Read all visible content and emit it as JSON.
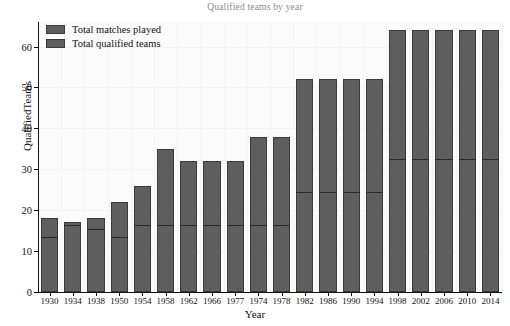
{
  "chart_data": {
    "type": "bar",
    "subtype": "stacked",
    "title": "Qualified teams by year",
    "xlabel": "Year",
    "ylabel": "QualifiedTeams",
    "ylim": [
      0,
      66
    ],
    "yticks": [
      0,
      10,
      20,
      30,
      40,
      50,
      60
    ],
    "grid": true,
    "legend_position": "top-left",
    "categories": [
      "1930",
      "1934",
      "1938",
      "1950",
      "1954",
      "1958",
      "1962",
      "1966",
      "1977",
      "1974",
      "1978",
      "1982",
      "1986",
      "1990",
      "1994",
      "1998",
      "2002",
      "2006",
      "2010",
      "2014"
    ],
    "series": [
      {
        "name": "Total matches played",
        "color": "#5e5e5e",
        "values": [
          18,
          17,
          18,
          22,
          26,
          35,
          32,
          32,
          32,
          38,
          38,
          52,
          52,
          52,
          52,
          64,
          64,
          64,
          64,
          64
        ]
      },
      {
        "name": "Total qualified teams",
        "color": "#5e5e5e",
        "values": [
          13,
          16,
          15,
          13,
          16,
          16,
          16,
          16,
          16,
          16,
          16,
          24,
          24,
          24,
          24,
          32,
          32,
          32,
          32,
          32
        ]
      }
    ]
  },
  "legend": {
    "items": [
      {
        "label": "Total matches played",
        "color": "#5e5e5e"
      },
      {
        "label": "Total qualified teams",
        "color": "#5e5e5e"
      }
    ]
  },
  "colors": {
    "bar_fill": "#5e5e5e",
    "bar_stroke": "#3a3a3a",
    "divider": "#2b2b2b",
    "plot_bg": "#fbfbfb",
    "title": "#8c8c8c",
    "axis": "#111111"
  }
}
